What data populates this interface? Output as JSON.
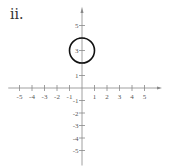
{
  "problem": {
    "label": "ii."
  },
  "chart_data": {
    "type": "scatter",
    "title": "",
    "xlabel": "",
    "ylabel": "",
    "xlim": [
      -5,
      5
    ],
    "ylim": [
      -5,
      5
    ],
    "grid": false,
    "x_ticks": [
      -5,
      -4,
      -3,
      -2,
      -1,
      1,
      2,
      3,
      4,
      5
    ],
    "y_ticks": [
      5,
      3,
      1,
      -1,
      -2,
      -3,
      -4,
      -5
    ],
    "shapes": [
      {
        "type": "circle",
        "center": [
          0,
          3
        ],
        "radius": 1
      }
    ],
    "origin_px": [
      82,
      88
    ],
    "unit_px": 12.5
  },
  "colors": {
    "axis": "#888888",
    "circle": "#111111"
  }
}
